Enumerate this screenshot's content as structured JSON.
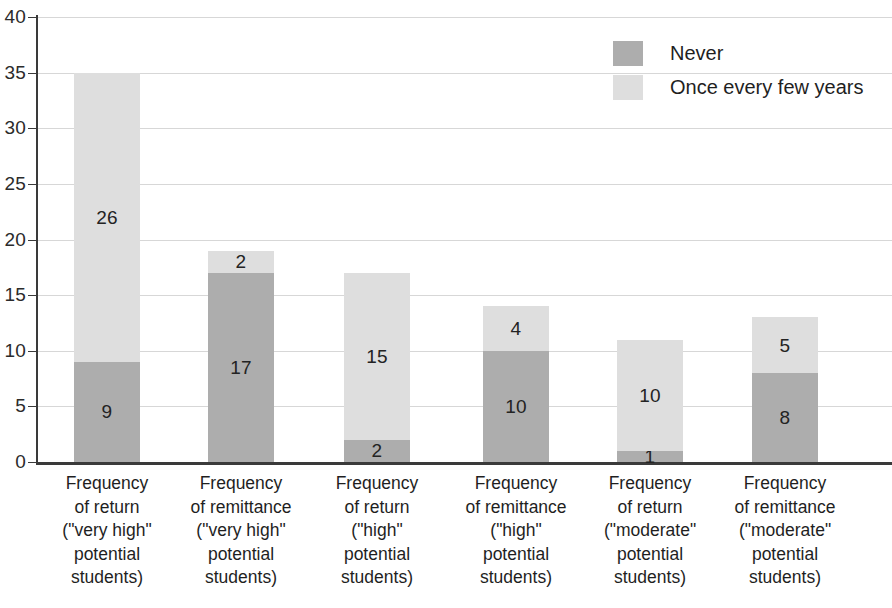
{
  "chart_data": {
    "type": "bar",
    "subtype": "stacked-vertical",
    "title": "",
    "xlabel": "",
    "ylabel": "",
    "ylim": [
      0,
      40
    ],
    "yticks": [
      0,
      5,
      10,
      15,
      20,
      25,
      30,
      35,
      40
    ],
    "grid": true,
    "legend_position": "top-right",
    "categories": [
      "Frequency of return (\"very high\" potential students)",
      "Frequency of remittance (\"very high\" potential students)",
      "Frequency of return (\"high\" potential students)",
      "Frequency of remittance (\"high\" potential students)",
      "Frequency of return (\"moderate\" potential students)",
      "Frequency of remittance (\"moderate\" potential students)"
    ],
    "category_lines": [
      [
        "Frequency",
        "of return",
        "(\"very high\"",
        "potential",
        "students)"
      ],
      [
        "Frequency",
        "of remittance",
        "(\"very high\"",
        "potential",
        "students)"
      ],
      [
        "Frequency",
        "of return",
        "(\"high\"",
        "potential",
        "students)"
      ],
      [
        "Frequency",
        "of remittance",
        "(\"high\"",
        "potential",
        "students)"
      ],
      [
        "Frequency",
        "of return",
        "(\"moderate\"",
        "potential",
        "students)"
      ],
      [
        "Frequency",
        "of remittance",
        "(\"moderate\"",
        "potential",
        "students)"
      ]
    ],
    "series": [
      {
        "name": "Never",
        "color": "#adadad",
        "values": [
          9,
          17,
          2,
          10,
          1,
          8
        ]
      },
      {
        "name": "Once every few years",
        "color": "#dedede",
        "values": [
          26,
          2,
          15,
          4,
          10,
          5
        ]
      }
    ],
    "totals": [
      35,
      19,
      17,
      14,
      11,
      13
    ]
  },
  "legend": {
    "items": [
      {
        "label": "Never",
        "swatch": "never"
      },
      {
        "label": "Once every few years",
        "swatch": "once"
      }
    ]
  },
  "axis": {
    "y_tick_labels": [
      "40",
      "35",
      "30",
      "25",
      "20",
      "15",
      "10",
      "5",
      "0"
    ]
  }
}
